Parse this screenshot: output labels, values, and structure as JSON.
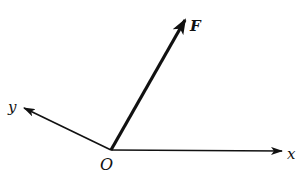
{
  "diagram": {
    "type": "vector-force-diagram",
    "origin": {
      "label": "O",
      "x": 111,
      "y": 150
    },
    "axes": [
      {
        "name": "x",
        "label": "x",
        "tip": {
          "x": 282,
          "y": 151
        }
      },
      {
        "name": "y",
        "label": "y",
        "tip": {
          "x": 24,
          "y": 108
        }
      }
    ],
    "vectors": [
      {
        "name": "F",
        "label": "F",
        "tip": {
          "x": 185,
          "y": 20
        },
        "bold": true
      }
    ],
    "colors": {
      "line": "#111111",
      "background": "#ffffff"
    }
  }
}
